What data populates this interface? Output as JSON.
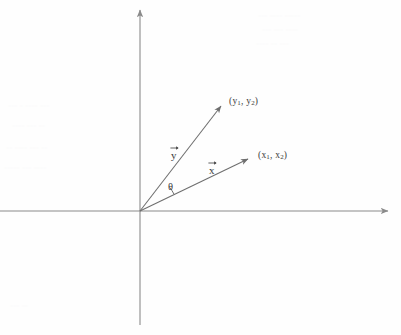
{
  "figure": {
    "name": "vector-angle-diagram",
    "width": 401,
    "height": 335,
    "background_color": "#fefefe",
    "stroke_color": "#8a8a8a",
    "text_color": "#3b3b3b"
  },
  "axes": {
    "origin": {
      "x": 140,
      "y": 211
    },
    "horizontal": {
      "name": "horizontal-axis",
      "x_start": 0,
      "x_end": 390,
      "y": 211,
      "arrowhead": "right"
    },
    "vertical": {
      "name": "vertical-axis",
      "x": 140,
      "y_start": 8,
      "y_end": 325,
      "arrowhead": "up"
    }
  },
  "vectors": [
    {
      "id": "vector-y",
      "label": "y",
      "label_x": 171,
      "label_y": 147,
      "tip": {
        "x": 224,
        "y": 103
      },
      "point_label": "(y1, y2)",
      "point_components": [
        "y",
        "1",
        "y",
        "2"
      ]
    },
    {
      "id": "vector-x",
      "label": "x",
      "label_x": 209,
      "label_y": 162,
      "tip": {
        "x": 252,
        "y": 157
      },
      "point_label": "(x1, x2)",
      "point_components": [
        "x",
        "1",
        "x",
        "2"
      ]
    }
  ],
  "angle": {
    "name": "theta-angle",
    "label": "θ",
    "arc_radius": 38,
    "between": [
      "vector-x",
      "vector-y"
    ]
  },
  "labels": {
    "point_y": {
      "open": "(",
      "base1": "y",
      "sub1": "1",
      "comma": ", ",
      "base2": "y",
      "sub2": "2",
      "close": ")"
    },
    "point_x": {
      "open": "(",
      "base1": "x",
      "sub1": "1",
      "comma": ", ",
      "base2": "x",
      "sub2": "2",
      "close": ")"
    },
    "vector_y_glyph": "y",
    "vector_x_glyph": "x",
    "theta_glyph": "θ"
  }
}
